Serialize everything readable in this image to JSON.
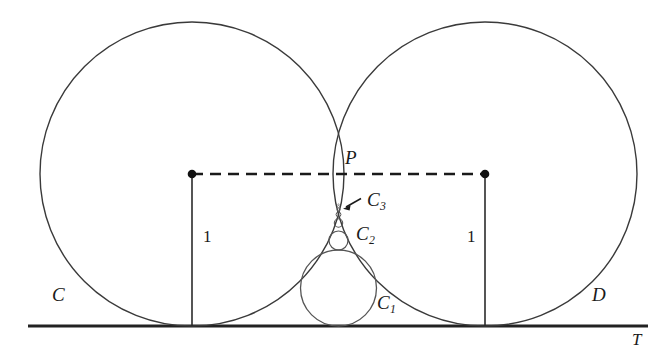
{
  "figure": {
    "type": "geometry-diagram",
    "background_color": "#ffffff",
    "stroke_color": "#2b2b2b",
    "width": 668,
    "height": 349
  },
  "labels": {
    "circle_c": "C",
    "circle_d": "D",
    "tangency_point": "P",
    "tangent_line": "T",
    "radius_left": "1",
    "radius_right": "1",
    "chain_1": "C",
    "chain_1_sub": "1",
    "chain_2": "C",
    "chain_2_sub": "2",
    "chain_3": "C",
    "chain_3_sub": "3"
  },
  "geometry": {
    "baseline": {
      "y": 326,
      "x_start": 28,
      "x_end": 648
    },
    "circle_c": {
      "cx": 192,
      "cy": 174,
      "r": 152
    },
    "circle_d": {
      "cx": 485,
      "cy": 174,
      "r": 152
    },
    "point_p": {
      "x": 338.5,
      "y": 174
    },
    "center_dot_left": {
      "x": 192,
      "y": 174,
      "r": 4
    },
    "center_dot_right": {
      "x": 485,
      "y": 174,
      "r": 4
    },
    "dashed_segment": {
      "x1": 192,
      "y1": 174,
      "x2": 485,
      "y2": 174
    },
    "radius_line_left": {
      "x": 192,
      "y1": 174,
      "y2": 326
    },
    "radius_line_right": {
      "x": 485,
      "y1": 174,
      "y2": 326
    },
    "chain_circles": [
      {
        "name": "C1",
        "cx": 338.5,
        "cy": 288,
        "r": 38
      },
      {
        "name": "C2",
        "cx": 338.5,
        "cy": 240.5,
        "r": 9.5
      },
      {
        "name": "C3",
        "cx": 338.5,
        "cy": 223,
        "r": 4.2
      },
      {
        "name": "C4",
        "cx": 338.5,
        "cy": 214.5,
        "r": 2.4
      },
      {
        "name": "C5",
        "cx": 338.5,
        "cy": 209.6,
        "r": 1.5
      },
      {
        "name": "C6",
        "cx": 338.5,
        "cy": 206.5,
        "r": 1.1
      },
      {
        "name": "C7",
        "cx": 338.5,
        "cy": 204.4,
        "r": 0.8
      }
    ],
    "arrow_c3": {
      "x1": 360,
      "y1": 199,
      "x2": 344,
      "y2": 208
    }
  },
  "label_positions": {
    "circle_c": {
      "left": 52,
      "top": 285
    },
    "circle_d": {
      "left": 592,
      "top": 285
    },
    "point_p": {
      "left": 345,
      "top": 148
    },
    "tangent_line": {
      "left": 632,
      "top": 332
    },
    "radius_left": {
      "left": 202,
      "top": 227
    },
    "radius_right": {
      "left": 466,
      "top": 227
    },
    "chain_1": {
      "left": 377,
      "top": 295
    },
    "chain_2": {
      "left": 355,
      "top": 225
    },
    "chain_3": {
      "left": 366,
      "top": 190
    }
  }
}
